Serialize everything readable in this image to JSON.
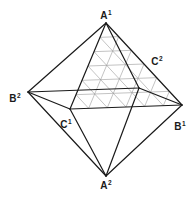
{
  "diagram": {
    "colors": {
      "edge": "#1a1a1a",
      "grid": "#9a9a9a",
      "background": "#ffffff"
    },
    "vertices": {
      "A1": {
        "x": 106,
        "y": 23
      },
      "A2": {
        "x": 106,
        "y": 176
      },
      "B1": {
        "x": 182,
        "y": 105
      },
      "B2": {
        "x": 28,
        "y": 92
      },
      "C1": {
        "x": 70,
        "y": 109
      },
      "C2": {
        "x": 139,
        "y": 88
      }
    },
    "edges": [
      [
        "A1",
        "B2"
      ],
      [
        "A1",
        "B1"
      ],
      [
        "A1",
        "C1"
      ],
      [
        "A1",
        "C2"
      ],
      [
        "A2",
        "B2"
      ],
      [
        "A2",
        "B1"
      ],
      [
        "A2",
        "C1"
      ],
      [
        "A2",
        "C2"
      ],
      [
        "B2",
        "C1"
      ],
      [
        "C1",
        "B1"
      ],
      [
        "B1",
        "C2"
      ],
      [
        "C2",
        "B2"
      ]
    ],
    "gridded_face": {
      "vertices": [
        "A1",
        "C1",
        "B1"
      ],
      "divisions": 6
    },
    "labels": [
      {
        "id": "A1",
        "base": "A",
        "sup": "1",
        "x": 106,
        "y": 15
      },
      {
        "id": "A2",
        "base": "A",
        "sup": "2",
        "x": 106,
        "y": 185
      },
      {
        "id": "B1",
        "base": "B",
        "sup": "1",
        "x": 180,
        "y": 126
      },
      {
        "id": "B2",
        "base": "B",
        "sup": "2",
        "x": 15,
        "y": 98
      },
      {
        "id": "C1",
        "base": "C",
        "sup": "1",
        "x": 66,
        "y": 124
      },
      {
        "id": "C2",
        "base": "C",
        "sup": "2",
        "x": 157,
        "y": 61
      }
    ]
  }
}
